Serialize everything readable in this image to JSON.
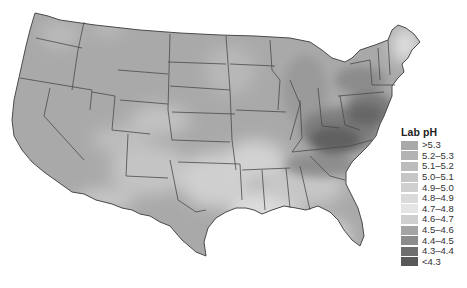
{
  "map": {
    "title": "Lab pH",
    "region": "Contiguous United States",
    "background_color": "#ffffff",
    "border_color": "#4a4a4a"
  },
  "legend": {
    "title": "Lab pH",
    "items": [
      {
        "label": ">5.3",
        "color": "#a9a9a9"
      },
      {
        "label": "5.2–5.3",
        "color": "#b3b3b3"
      },
      {
        "label": "5.1–5.2",
        "color": "#bcbcbc"
      },
      {
        "label": "5.0–5.1",
        "color": "#c6c6c6"
      },
      {
        "label": "4.9–5.0",
        "color": "#d0d0d0"
      },
      {
        "label": "4.8–4.9",
        "color": "#dadada"
      },
      {
        "label": "4.7–4.8",
        "color": "#e4e4e4"
      },
      {
        "label": "4.6–4.7",
        "color": "#cfcfcf"
      },
      {
        "label": "4.5–4.6",
        "color": "#a4a4a4"
      },
      {
        "label": "4.4–4.5",
        "color": "#8c8c8c"
      },
      {
        "label": "4.3–4.4",
        "color": "#6e6e6e"
      },
      {
        "label": "<4.3",
        "color": "#595959"
      }
    ]
  }
}
